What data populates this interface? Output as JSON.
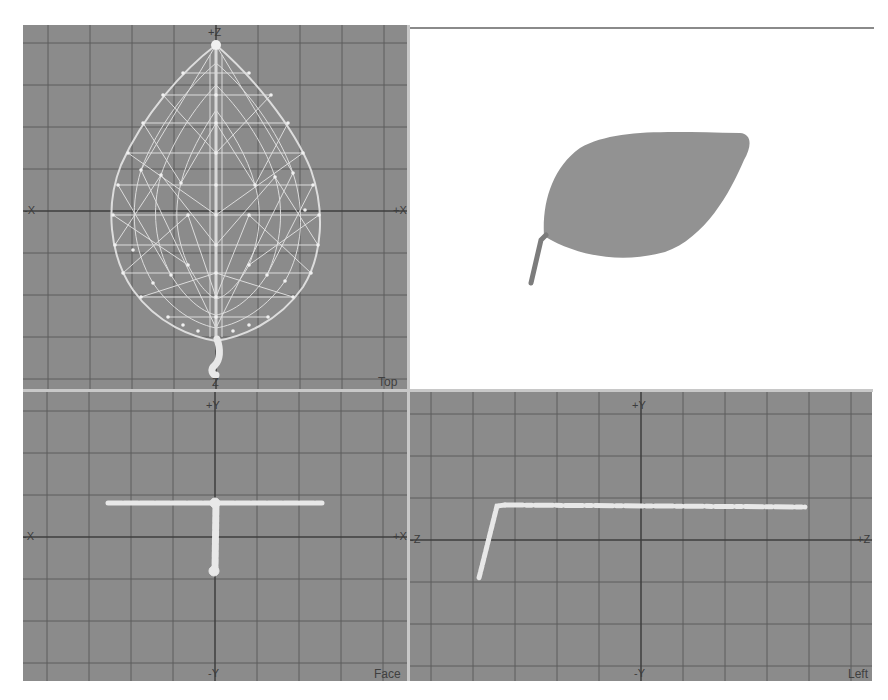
{
  "viewports": {
    "top": {
      "name": "Top",
      "axis_labels": {
        "up": "+Z",
        "down": "Z",
        "left": "-X",
        "right": "+X"
      }
    },
    "perspective": {
      "name": ""
    },
    "face": {
      "name": "Face",
      "axis_labels": {
        "up": "+Y",
        "down": "-Y",
        "left": "-X",
        "right": "+X"
      }
    },
    "left": {
      "name": "Left",
      "axis_labels": {
        "up": "+Y",
        "down": "-Y",
        "left": "-Z",
        "right": "+Z"
      }
    }
  },
  "colors": {
    "viewport_bg": "#8b8b8b",
    "grid_line": "#5c5c5c",
    "axis_line": "#3e3e3e",
    "wireframe": "#e6e6e6",
    "shaded_leaf": "#929292",
    "divider": "#c8c8c8"
  },
  "object": {
    "type": "leaf mesh",
    "grid_spacing_px": 42
  }
}
